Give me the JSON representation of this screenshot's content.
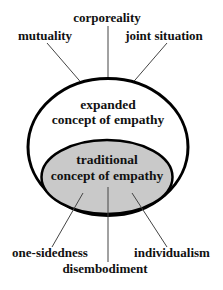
{
  "diagram": {
    "colors": {
      "background": "#ffffff",
      "outline": "#000000",
      "inner_fill": "#c9c9c9",
      "leader_line": "#444444",
      "text": "#111111"
    },
    "outer_concept": {
      "line1": "expanded",
      "line2": "concept of empathy"
    },
    "inner_concept": {
      "line1": "traditional",
      "line2": "concept of empathy"
    },
    "expanded_aspects": [
      {
        "label": "mutuality"
      },
      {
        "label": "corporeality"
      },
      {
        "label": "joint situation"
      }
    ],
    "traditional_aspects": [
      {
        "label": "one-sidedness"
      },
      {
        "label": "disembodiment"
      },
      {
        "label": "individualism"
      }
    ]
  }
}
